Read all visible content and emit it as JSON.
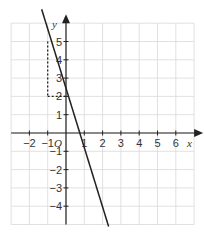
{
  "chart_data": {
    "type": "line",
    "title": "",
    "xlabel": "x",
    "ylabel": "y",
    "origin_label": "O",
    "xlim": [
      -3,
      7
    ],
    "ylim": [
      -5,
      6
    ],
    "grid": true,
    "x_ticks": [
      -2,
      -1,
      1,
      2,
      3,
      4,
      5,
      6
    ],
    "y_ticks": [
      5,
      4,
      3,
      2,
      1,
      -1,
      -2,
      -3,
      -4
    ],
    "x_tick_labels": [
      "−2",
      "−1",
      "1",
      "2",
      "3",
      "4",
      "5",
      "6"
    ],
    "y_tick_labels": [
      "5",
      "4",
      "3",
      "2",
      "1",
      "−1",
      "−2",
      "−3",
      "−4"
    ],
    "series": [
      {
        "name": "y = -3x + 2",
        "equation": "y = -3x + 2",
        "slope": -3,
        "intercept": 2,
        "x": [
          -1.33,
          2.33
        ],
        "y": [
          6,
          -5
        ],
        "style": "solid"
      }
    ],
    "annotations": [
      {
        "type": "dashed-segment",
        "from": [
          -1,
          5
        ],
        "to": [
          -1,
          2
        ],
        "meaning": "rise of 3"
      },
      {
        "type": "dashed-segment",
        "from": [
          -1,
          2
        ],
        "to": [
          0,
          2
        ],
        "meaning": "run of 1"
      }
    ]
  },
  "colors": {
    "grid": "#d9d9d9",
    "axis": "#222222",
    "line": "#222222",
    "text": "#333333"
  }
}
